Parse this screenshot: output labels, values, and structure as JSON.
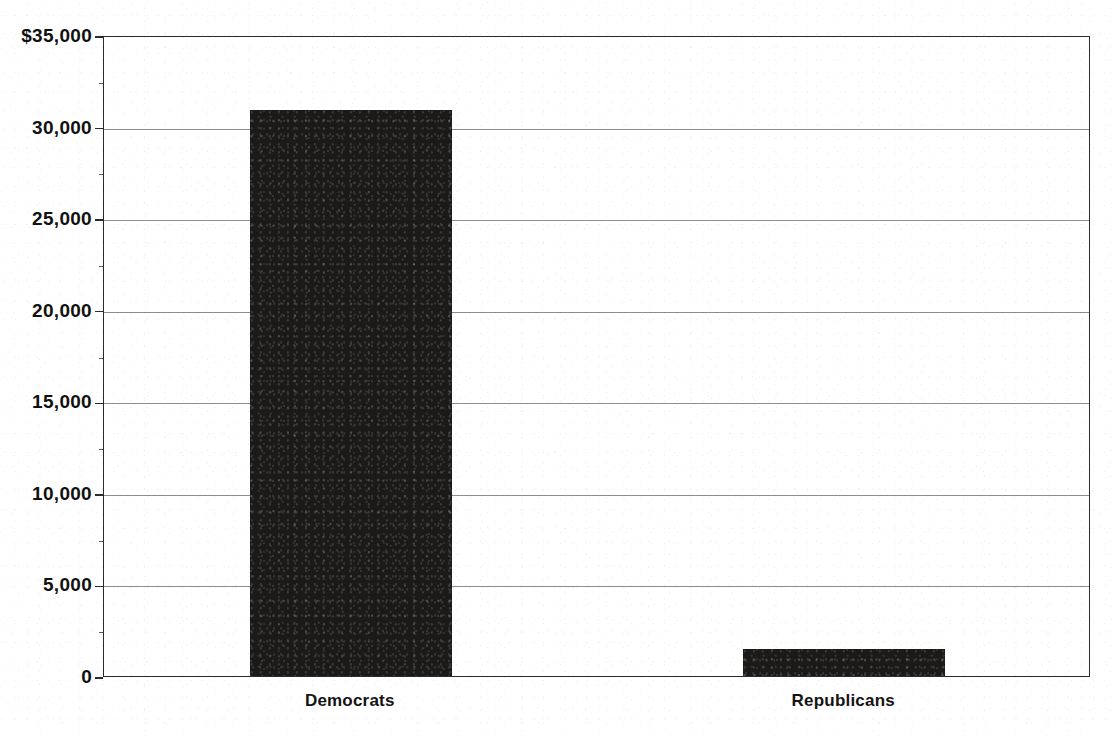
{
  "chart_data": {
    "type": "bar",
    "title": "",
    "subtitle": "",
    "xlabel": "",
    "ylabel": "",
    "categories": [
      "Democrats",
      "Republicans"
    ],
    "values": [
      30900,
      1500
    ],
    "series": [
      {
        "name": "",
        "values": [
          30900,
          1500
        ],
        "color": "#1c1a19"
      }
    ],
    "ylim": [
      0,
      35000
    ],
    "y_tick_step": 5000,
    "y_tick_labels": [
      "$35,000",
      "30,000",
      "25,000",
      "20,000",
      "15,000",
      "10,000",
      "5,000",
      "0"
    ],
    "y_tick_values": [
      35000,
      30000,
      25000,
      20000,
      15000,
      10000,
      5000,
      0
    ],
    "grid": true,
    "grid_axis": "y",
    "legend": false,
    "legend_position": "none",
    "currency_prefix": "$",
    "bar_color": "#1c1a19",
    "grid_color": "#8d8d8d",
    "axis_color": "#2b2b2b"
  },
  "axis": {
    "y_labels": [
      {
        "text": "$35,000",
        "value": 35000
      },
      {
        "text": "30,000",
        "value": 30000
      },
      {
        "text": "25,000",
        "value": 25000
      },
      {
        "text": "20,000",
        "value": 20000
      },
      {
        "text": "15,000",
        "value": 15000
      },
      {
        "text": "10,000",
        "value": 10000
      },
      {
        "text": "5,000",
        "value": 5000
      },
      {
        "text": "0",
        "value": 0
      }
    ]
  },
  "bars": [
    {
      "label": "Democrats",
      "value": 30900
    },
    {
      "label": "Republicans",
      "value": 1500
    }
  ]
}
